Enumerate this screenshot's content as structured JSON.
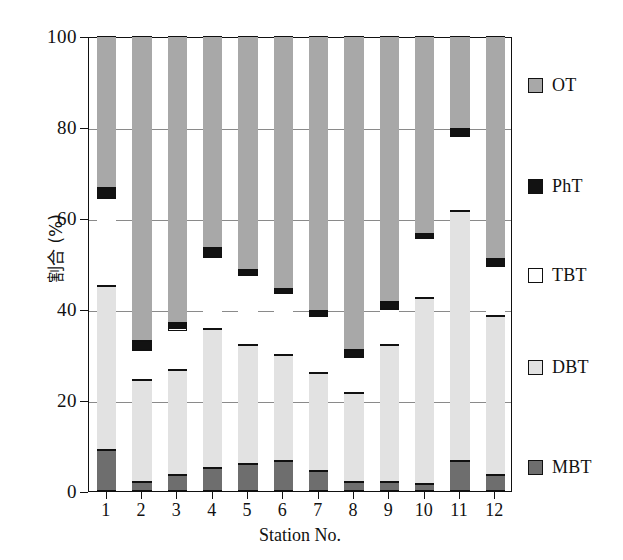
{
  "chart_data": {
    "type": "bar",
    "subtype": "stacked-bar-100-percent",
    "title": "",
    "xlabel": "Station No.",
    "ylabel": "割合 (%)",
    "ylim": [
      0,
      100
    ],
    "yticks": [
      0,
      20,
      40,
      60,
      80,
      100
    ],
    "ytick_labels": [
      "0",
      "20",
      "40",
      "60",
      "80",
      "100"
    ],
    "grid": true,
    "grid_axis": "y",
    "legend_position": "right",
    "categories": [
      "1",
      "2",
      "3",
      "4",
      "5",
      "6",
      "7",
      "8",
      "9",
      "10",
      "11",
      "12"
    ],
    "series": [
      {
        "name": "MBT",
        "color": "#6e6e6e",
        "values": [
          9.0,
          2.0,
          3.5,
          5.0,
          6.0,
          6.5,
          4.5,
          2.0,
          2.0,
          1.5,
          6.5,
          3.5
        ]
      },
      {
        "name": "DBT",
        "color": "#e2e2e2",
        "values": [
          36.0,
          22.5,
          23.0,
          30.5,
          26.0,
          23.5,
          21.5,
          19.5,
          30.0,
          41.0,
          55.0,
          35.0
        ]
      },
      {
        "name": "TBT",
        "color": "#ffffff",
        "values": [
          19.5,
          6.5,
          9.0,
          16.0,
          15.5,
          13.5,
          12.5,
          8.0,
          8.0,
          13.0,
          16.5,
          11.0
        ]
      },
      {
        "name": "PhT",
        "color": "#121212",
        "values": [
          2.0,
          2.0,
          1.5,
          2.0,
          1.0,
          1.0,
          1.0,
          1.5,
          1.5,
          1.0,
          1.5,
          1.5
        ]
      },
      {
        "name": "OT",
        "color": "#a8a8a8",
        "values": [
          33.5,
          67.0,
          63.0,
          46.5,
          51.5,
          55.5,
          60.5,
          69.0,
          58.5,
          43.5,
          20.5,
          49.0
        ]
      }
    ],
    "cumulative_tops": {
      "note": "Upper boundary (%) of each stack level per station, bottom to top",
      "MBT": [
        9.0,
        2.0,
        3.5,
        5.0,
        6.0,
        6.5,
        4.5,
        2.0,
        2.0,
        1.5,
        6.5,
        3.5
      ],
      "DBT": [
        45.0,
        24.5,
        26.5,
        35.5,
        32.0,
        30.0,
        26.0,
        21.5,
        32.0,
        42.5,
        61.5,
        38.5
      ],
      "TBT": [
        64.5,
        31.0,
        35.5,
        51.5,
        47.5,
        43.5,
        38.5,
        29.5,
        40.0,
        55.5,
        78.0,
        49.5
      ],
      "PhT": [
        66.5,
        33.0,
        37.0,
        53.5,
        48.5,
        44.5,
        39.5,
        31.0,
        41.5,
        56.5,
        79.5,
        51.0
      ],
      "OT": [
        100,
        100,
        100,
        100,
        100,
        100,
        100,
        100,
        100,
        100,
        100,
        100
      ]
    }
  },
  "legend": {
    "items": [
      {
        "label": "OT",
        "swatch": "ot"
      },
      {
        "label": "PhT",
        "swatch": "pht"
      },
      {
        "label": "TBT",
        "swatch": "tbt"
      },
      {
        "label": "DBT",
        "swatch": "dbt"
      },
      {
        "label": "MBT",
        "swatch": "mbt"
      }
    ]
  }
}
